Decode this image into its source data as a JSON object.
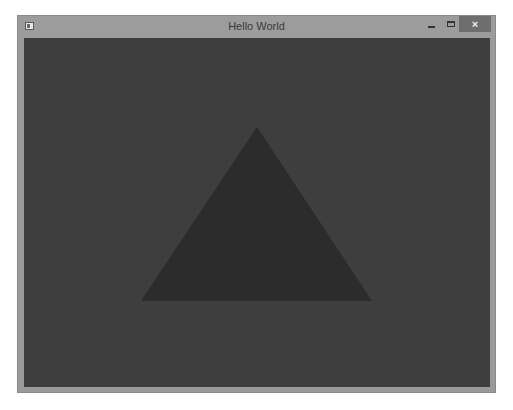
{
  "window": {
    "title": "Hello World",
    "icon": "app-window-icon",
    "controls": {
      "minimize": "minimize-icon",
      "maximize": "maximize-icon",
      "close_label": "×"
    }
  },
  "canvas": {
    "background_color": "#3e3e3e",
    "shape": "triangle",
    "triangle_color": "#2c2c2c",
    "vertices": [
      [
        233,
        89
      ],
      [
        117,
        263
      ],
      [
        348,
        263
      ]
    ]
  }
}
